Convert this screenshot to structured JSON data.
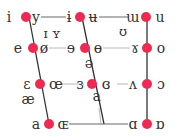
{
  "colors": {
    "dot": "#ee2a52",
    "text": "#333333",
    "line": "#333333"
  },
  "rows": [
    {
      "name": "close",
      "pairs": [
        {
          "unrounded": "i",
          "rounded": "y"
        },
        {
          "unrounded": "ɨ",
          "rounded": "ʉ"
        },
        {
          "unrounded": "ɯ",
          "rounded": "u"
        }
      ]
    },
    {
      "name": "close-mid",
      "pairs": [
        {
          "unrounded": "e",
          "rounded": "ø"
        },
        {
          "unrounded": "ɘ",
          "rounded": "ɵ"
        },
        {
          "unrounded": "ɤ",
          "rounded": "o"
        }
      ]
    },
    {
      "name": "open-mid",
      "pairs": [
        {
          "unrounded": "ɛ",
          "rounded": "œ"
        },
        {
          "unrounded": "ɜ",
          "rounded": "ɞ"
        },
        {
          "unrounded": "ʌ",
          "rounded": "ɔ"
        }
      ]
    },
    {
      "name": "open",
      "pairs": [
        {
          "unrounded": "a",
          "rounded": "ɶ"
        },
        {
          "unrounded": "ɑ",
          "rounded": "ɒ"
        }
      ]
    }
  ],
  "extras": {
    "near_close_front": "ɪ ʏ",
    "near_close_back": "ʊ",
    "mid_central": "ə",
    "near_open_front": "æ",
    "near_open_central": "ɐ"
  }
}
